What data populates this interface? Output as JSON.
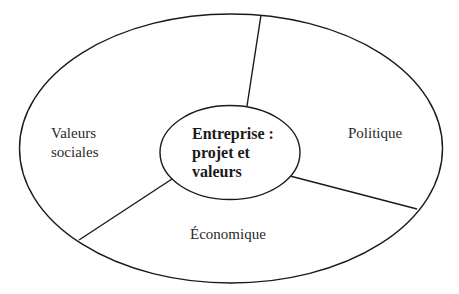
{
  "diagram": {
    "type": "concentric-ellipse-sector-diagram",
    "center": {
      "lines": [
        "Entreprise :",
        "projet et",
        "valeurs"
      ]
    },
    "sectors": [
      {
        "id": "valeurs-sociales",
        "lines": [
          "Valeurs",
          "sociales"
        ],
        "position": "left"
      },
      {
        "id": "politique",
        "lines": [
          "Politique"
        ],
        "position": "right"
      },
      {
        "id": "economique",
        "lines": [
          "Économique"
        ],
        "position": "bottom"
      }
    ],
    "colors": {
      "stroke": "#1a1a1a",
      "background": "#ffffff",
      "text": "#2a2a2a"
    }
  }
}
